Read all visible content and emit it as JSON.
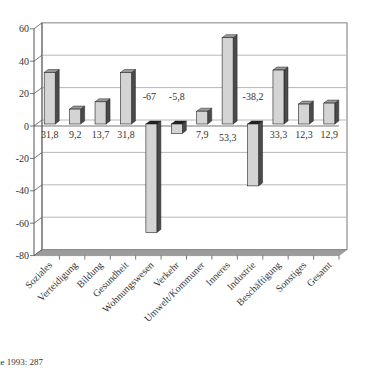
{
  "chart_data": {
    "type": "bar",
    "title": "",
    "xlabel": "",
    "ylabel": "",
    "ylim": [
      -80,
      60
    ],
    "yticks": [
      60,
      40,
      20,
      0,
      -20,
      -40,
      -60,
      -80
    ],
    "grid": true,
    "legend": null,
    "style": "3d-column",
    "categories": [
      "Soziales",
      "Verteidigung",
      "Bildung",
      "Gesundheit",
      "Wohnungswesen",
      "Verkehr",
      "Umwelt/Kommuner",
      "Inneres",
      "Industrie",
      "Beschäftigung",
      "Sonstiges",
      "Gesamt"
    ],
    "values": [
      31.8,
      9.2,
      13.7,
      31.8,
      -67,
      -5.8,
      7.9,
      53.3,
      -38.2,
      33.3,
      12.3,
      12.9
    ],
    "data_labels": [
      "31,8",
      "9,2",
      "13,7",
      "31,8",
      "-67",
      "-5,8",
      "7,9",
      "53,3",
      "-38,2",
      "33,3",
      "12,3",
      "12,9"
    ]
  },
  "colors": {
    "bar_front": "#d4d4d4",
    "bar_top": "#9a9a9a",
    "bar_side": "#4a4a4a",
    "floor": "#9c9c9c",
    "gridline": "#b8b8b8",
    "axis": "#555555"
  },
  "footer": {
    "text": "ue 1993: 287"
  }
}
